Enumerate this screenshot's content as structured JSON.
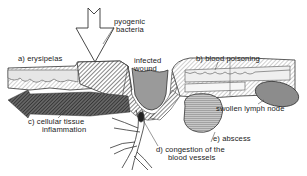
{
  "diagram": {
    "labels": {
      "pyogenic_bacteria_line1": "pyogenic",
      "pyogenic_bacteria_line2": "bacteria",
      "erysipelas": "a)  erysipelas",
      "infected_wound_line1": "infected",
      "infected_wound_line2": "wound",
      "blood_poisoning": "b)  blood poisoning",
      "swollen_lymph_node": "swollen lymph node",
      "cellular_tissue_line1": "c)  cellular tissue",
      "cellular_tissue_line2": "inflammation",
      "abscess": "e)  abscess",
      "congestion_line1": "d)  congestion of the",
      "congestion_line2": "blood vessels"
    },
    "colors": {
      "outline": "#2a2a2a",
      "hatch_dark": "#555555",
      "wound_gray": "#9a9a9a",
      "cellular_dark": "#3c3c3c",
      "lymph_node": "#8c8c8c",
      "abscess_fill": "#b8b8b8",
      "background": "#ffffff"
    }
  }
}
